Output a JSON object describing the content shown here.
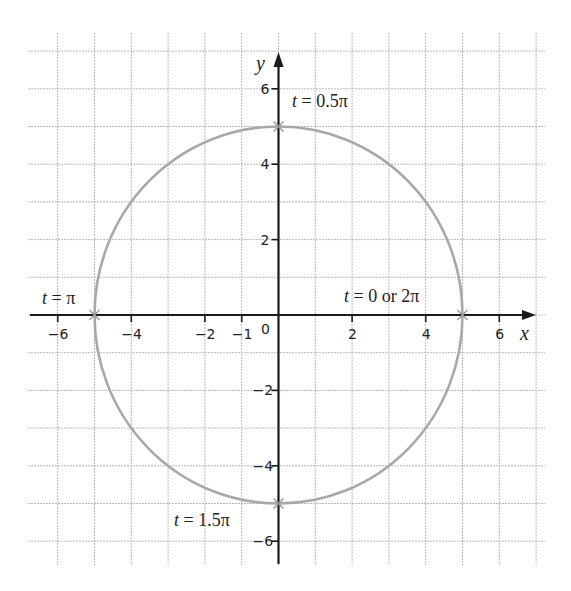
{
  "chart_data": {
    "type": "line",
    "title": "",
    "subtitle": "Parametric circle x = 5cos t, y = 5sin t",
    "xlabel": "x",
    "ylabel": "y",
    "xlim": [
      -6,
      6
    ],
    "ylim": [
      -6,
      6
    ],
    "grid": true,
    "grid_step": 1,
    "x_ticks": [
      -6,
      -4,
      -2,
      -1,
      2,
      4,
      6
    ],
    "x_tick_labels": [
      "-6",
      "-4",
      "-2",
      "-1",
      "2",
      "4",
      "6"
    ],
    "y_ticks": [
      6,
      4,
      2,
      -2,
      -4,
      -6
    ],
    "y_tick_labels": [
      "6",
      "4",
      "2",
      "-2",
      "-4",
      "-6"
    ],
    "origin_label": "0",
    "series": [
      {
        "name": "circle",
        "type": "circle",
        "center": [
          0,
          0
        ],
        "radius": 5,
        "color": "#a8a8a8"
      }
    ],
    "points": [
      {
        "x": 5,
        "y": 0,
        "label": "t = 0 or 2π"
      },
      {
        "x": 0,
        "y": 5,
        "label": "t = 0.5π"
      },
      {
        "x": -5,
        "y": 0,
        "label": "t = π"
      },
      {
        "x": 0,
        "y": -5,
        "label": "t = 1.5π"
      }
    ],
    "annotations": [
      {
        "t": "t",
        "rest": " = 0.5π",
        "x": 0,
        "y": 5
      },
      {
        "t": "t",
        "rest": " = π",
        "x": -5,
        "y": 0
      },
      {
        "t": "t",
        "rest": " = 0 or 2π",
        "x": 5,
        "y": 0
      },
      {
        "t": "t",
        "rest": " = 1.5π",
        "x": 0,
        "y": -5
      }
    ],
    "colors": {
      "grid": "#b9b9b9",
      "axes": "#1a1a1a",
      "curve": "#a8a8a8",
      "marker": "#9a9a9a"
    }
  }
}
